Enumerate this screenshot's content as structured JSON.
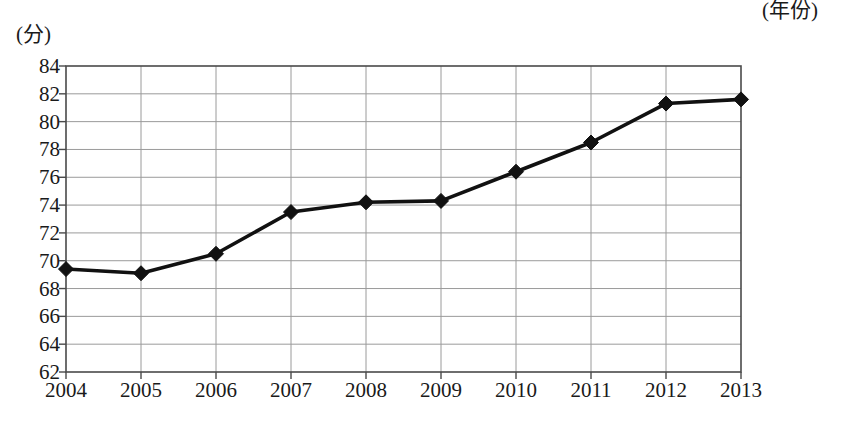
{
  "chart_data": {
    "type": "line",
    "title": "",
    "subtitle": "",
    "xlabel": "(年份)",
    "ylabel": "(分)",
    "categories": [
      "2004",
      "2005",
      "2006",
      "2007",
      "2008",
      "2009",
      "2010",
      "2011",
      "2012",
      "2013"
    ],
    "x": [
      2004,
      2005,
      2006,
      2007,
      2008,
      2009,
      2010,
      2011,
      2012,
      2013
    ],
    "values": [
      69.4,
      69.1,
      70.5,
      73.5,
      74.2,
      74.3,
      76.4,
      78.5,
      81.3,
      81.6
    ],
    "series": [
      {
        "name": "",
        "values": [
          69.4,
          69.1,
          70.5,
          73.5,
          74.2,
          74.3,
          76.4,
          78.5,
          81.3,
          81.6
        ]
      }
    ],
    "ylim": [
      62,
      84
    ],
    "xlim": [
      2004,
      2013
    ],
    "y_ticks": [
      62,
      64,
      66,
      68,
      70,
      72,
      74,
      76,
      78,
      80,
      82,
      84
    ],
    "y_tick_labels": [
      "62",
      "64",
      "66",
      "68",
      "70",
      "72",
      "74",
      "76",
      "78",
      "80",
      "82",
      "84"
    ],
    "x_tick_labels": [
      "2004",
      "2005",
      "2006",
      "2007",
      "2008",
      "2009",
      "2010",
      "2011",
      "2012",
      "2013"
    ],
    "grid": true,
    "legend": null,
    "legend_position": "none",
    "annotations": [],
    "marker": "diamond",
    "line_color": "#111111",
    "marker_color": "#111111",
    "grid_color": "#9a9a9a",
    "axis_color": "#4a4a4a",
    "background_color": "#ffffff"
  }
}
